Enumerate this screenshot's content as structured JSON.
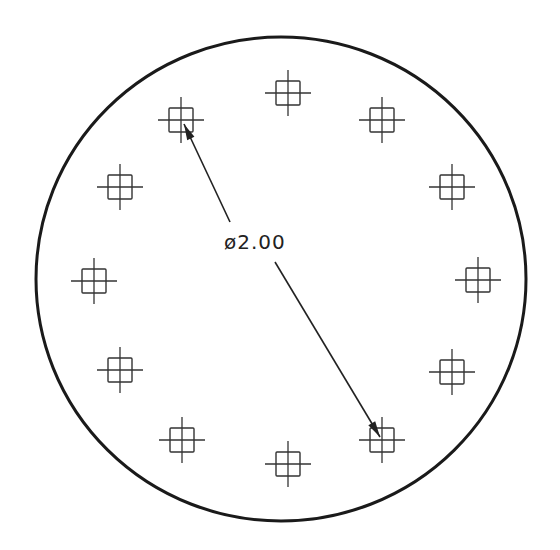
{
  "diagram": {
    "type": "bolt-circle-drawing",
    "outer_circle": {
      "cx": 281,
      "cy": 279,
      "rx": 245,
      "ry": 242,
      "stroke": "#1a1a1a",
      "stroke_width": 3
    },
    "marker_style": {
      "square_size": 24,
      "cross_length": 46,
      "stroke": "#333333"
    },
    "markers": [
      {
        "x": 288,
        "y": 93
      },
      {
        "x": 382,
        "y": 120
      },
      {
        "x": 452,
        "y": 187
      },
      {
        "x": 478,
        "y": 280
      },
      {
        "x": 452,
        "y": 372
      },
      {
        "x": 382,
        "y": 440
      },
      {
        "x": 288,
        "y": 464
      },
      {
        "x": 182,
        "y": 440
      },
      {
        "x": 120,
        "y": 370
      },
      {
        "x": 94,
        "y": 281
      },
      {
        "x": 120,
        "y": 187
      },
      {
        "x": 181,
        "y": 120
      }
    ],
    "dimension": {
      "label": "ø2.00",
      "label_x": 224,
      "label_y": 249,
      "leader_upper": {
        "x1": 230,
        "y1": 222,
        "x2": 184,
        "y2": 124
      },
      "leader_lower": {
        "x1": 275,
        "y1": 262,
        "x2": 380,
        "y2": 437
      }
    }
  }
}
